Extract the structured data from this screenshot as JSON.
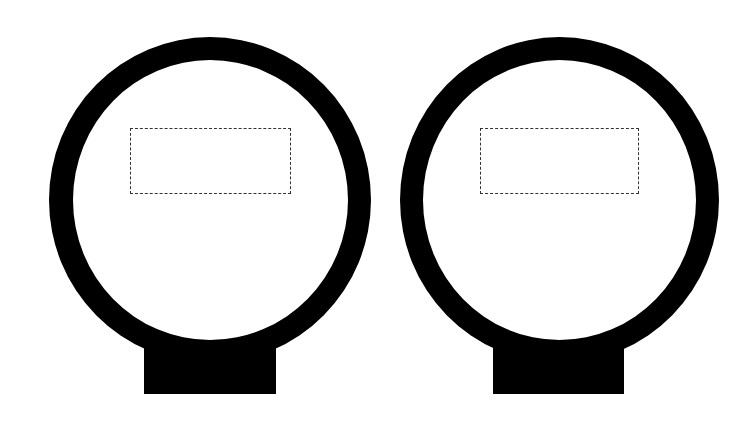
{
  "figure": {
    "colors": {
      "background": "#ffffff",
      "shape": "#000000",
      "dashed_frame": "#333333"
    },
    "items": [
      {
        "id": "left",
        "label": ""
      },
      {
        "id": "right",
        "label": ""
      }
    ]
  }
}
